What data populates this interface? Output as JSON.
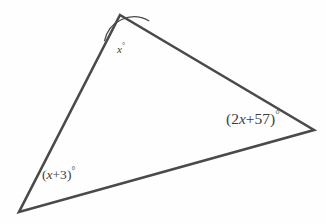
{
  "figure": {
    "type": "geometry-diagram",
    "shape": "triangle",
    "background_color": "#fefefe",
    "stroke_color": "#4a4a4a",
    "stroke_width": 2.6,
    "text_color": "#3d3d3d",
    "vertices": [
      {
        "name": "apex",
        "x": 120,
        "y": 15
      },
      {
        "name": "bottom-left",
        "x": 19,
        "y": 212
      },
      {
        "name": "right",
        "x": 314,
        "y": 130
      }
    ],
    "angle_arc": {
      "at_vertex": "apex",
      "radius": 30,
      "stroke_color": "#4a4a4a",
      "stroke_width": 1.3
    },
    "labels": {
      "apex": {
        "open_paren": "",
        "variable": "x",
        "rest": "",
        "close_paren": "",
        "degree": "°",
        "full_text": "x°"
      },
      "bottom_left": {
        "open_paren": "(",
        "variable": "x",
        "rest": "+3",
        "close_paren": ")",
        "degree": "°",
        "full_text": "(x+3)°"
      },
      "right": {
        "open_paren": "(2",
        "variable": "x",
        "rest": "+57",
        "close_paren": ")",
        "degree": "°",
        "full_text": "(2x+57)°"
      }
    }
  }
}
